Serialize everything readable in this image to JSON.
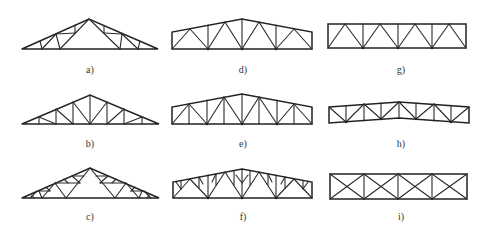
{
  "figure": {
    "type": "truss-types-diagram",
    "panels": [
      {
        "id": "a",
        "label": "a)",
        "shape": "triangular",
        "web": "fink-style"
      },
      {
        "id": "b",
        "label": "b)",
        "shape": "triangular",
        "web": "pratt-style with verticals"
      },
      {
        "id": "c",
        "label": "c)",
        "shape": "triangular",
        "web": "subdivided fink"
      },
      {
        "id": "d",
        "label": "d)",
        "shape": "trapezoidal",
        "web": "warren with verticals"
      },
      {
        "id": "e",
        "label": "e)",
        "shape": "trapezoidal",
        "web": "warren with intermediate verticals"
      },
      {
        "id": "f",
        "label": "f)",
        "shape": "trapezoidal",
        "web": "subdivided warren"
      },
      {
        "id": "g",
        "label": "g)",
        "shape": "parallel-chord",
        "web": "warren with verticals"
      },
      {
        "id": "h",
        "label": "h)",
        "shape": "parallel-chord sloped",
        "web": "warren with verticals"
      },
      {
        "id": "i",
        "label": "i)",
        "shape": "parallel-chord",
        "web": "cross-braced (X)"
      }
    ]
  },
  "colors": {
    "line": "#2a2a2a",
    "background": "#ffffff",
    "label": "#333333"
  }
}
